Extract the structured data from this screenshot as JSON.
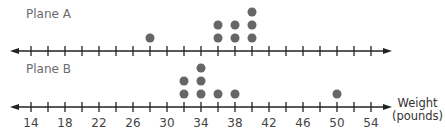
{
  "chart_data": {
    "type": "dot",
    "title": "",
    "xlabel": "Weight (pounds)",
    "xlabel_lines": [
      "Weight",
      "(pounds)"
    ],
    "xlim": [
      12,
      56
    ],
    "tick_step": 2,
    "tick_values": [
      14,
      16,
      18,
      20,
      22,
      24,
      26,
      28,
      30,
      32,
      34,
      36,
      38,
      40,
      42,
      44,
      46,
      48,
      50,
      52,
      54
    ],
    "tick_labels": [
      14,
      18,
      22,
      26,
      30,
      34,
      38,
      42,
      46,
      50,
      54
    ],
    "dot_color": "#666666",
    "axis_color": "#222222",
    "series": [
      {
        "name": "Plane A",
        "points": [
          {
            "x": 28,
            "count": 1
          },
          {
            "x": 36,
            "count": 2
          },
          {
            "x": 38,
            "count": 2
          },
          {
            "x": 40,
            "count": 3
          }
        ],
        "values": [
          28,
          36,
          36,
          38,
          38,
          40,
          40,
          40
        ]
      },
      {
        "name": "Plane B",
        "points": [
          {
            "x": 32,
            "count": 2
          },
          {
            "x": 34,
            "count": 3
          },
          {
            "x": 36,
            "count": 1
          },
          {
            "x": 38,
            "count": 1
          },
          {
            "x": 50,
            "count": 1
          }
        ],
        "values": [
          32,
          32,
          34,
          34,
          34,
          36,
          38,
          50
        ]
      }
    ]
  },
  "labels": {
    "plane_a": "Plane A",
    "plane_b": "Plane B",
    "weight_line1": "Weight",
    "weight_line2": "(pounds)"
  }
}
